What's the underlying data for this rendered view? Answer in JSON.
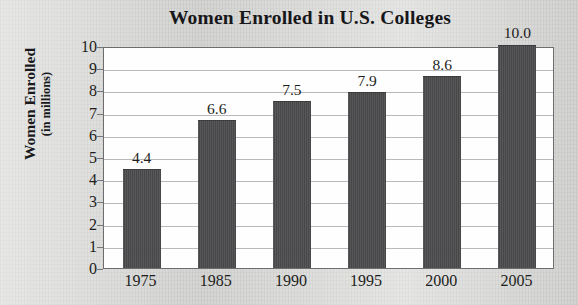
{
  "chart_data": {
    "type": "bar",
    "title": "Women Enrolled in U.S. Colleges",
    "xlabel": "",
    "ylabel": "Women Enrolled (in millions)",
    "ylabel_line1": "Women Enrolled",
    "ylabel_line2": "(in millions)",
    "categories": [
      "1975",
      "1985",
      "1990",
      "1995",
      "2000",
      "2005"
    ],
    "values": [
      4.4,
      6.6,
      7.5,
      7.9,
      8.6,
      10.0
    ],
    "value_labels": [
      "4.4",
      "6.6",
      "7.5",
      "7.9",
      "8.6",
      "10.0"
    ],
    "ylim": [
      0,
      10
    ],
    "ytick_labels": [
      "0",
      "1",
      "2",
      "3",
      "4",
      "5",
      "6",
      "7",
      "8",
      "9",
      "10"
    ],
    "ytick_values": [
      0,
      1,
      2,
      3,
      4,
      5,
      6,
      7,
      8,
      9,
      10
    ],
    "grid": true,
    "legend": null,
    "bar_color": "#4b4b4d",
    "plot_background": "#fefefe",
    "page_background": "#d9d9d7"
  }
}
